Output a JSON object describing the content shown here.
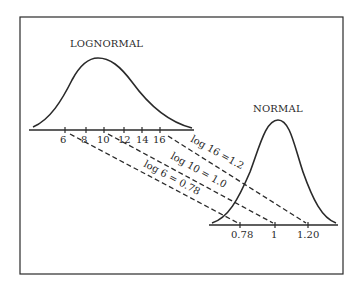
{
  "diagram": {
    "lognormal": {
      "title": "LOGNORMAL",
      "tick_labels": [
        "6",
        "8",
        "10",
        "12",
        "14",
        "16"
      ]
    },
    "normal": {
      "title": "NORMAL",
      "tick_labels": [
        "0.78",
        "1",
        "1.20"
      ]
    },
    "mappings": [
      {
        "from": "16",
        "to": "1.20",
        "label": "log 16 =1.2"
      },
      {
        "from": "10",
        "to": "1",
        "label": "log 10 = 1.0"
      },
      {
        "from": "6",
        "to": "0.78",
        "label": "log 6 = 0.78"
      }
    ]
  },
  "colors": {
    "ink": "#2a2a2a",
    "background": "#ffffff"
  }
}
